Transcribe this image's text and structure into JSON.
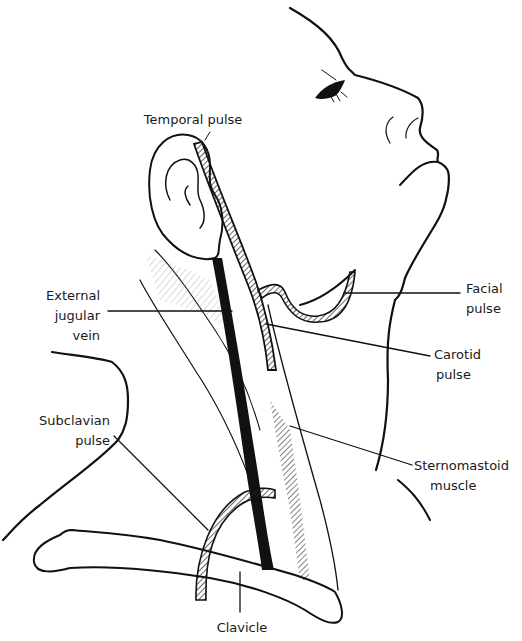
{
  "figure": {
    "type": "anatomical line drawing",
    "labels": {
      "temporal": "Temporal pulse",
      "external_jugular_1": "External",
      "external_jugular_2": "jugular",
      "external_jugular_3": "vein",
      "facial_1": "Facial",
      "facial_2": "pulse",
      "carotid_1": "Carotid",
      "carotid_2": "pulse",
      "subclavian_1": "Subclavian",
      "subclavian_2": "pulse",
      "sternomastoid_1": "Sternomastoid",
      "sternomastoid_2": "muscle",
      "clavicle": "Clavicle"
    },
    "colors": {
      "ink": "#111111",
      "background": "#ffffff"
    }
  }
}
